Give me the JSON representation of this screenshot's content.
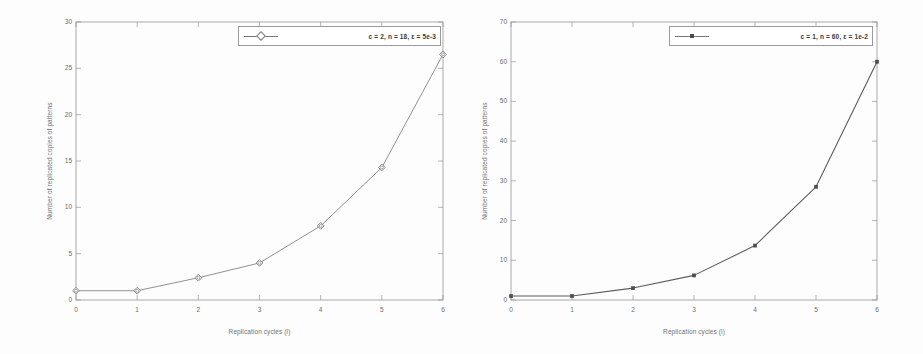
{
  "figure": {
    "panel_count": 2
  },
  "chart_data": [
    {
      "type": "line",
      "panel": "left",
      "title": "",
      "xlabel": "Replication cycles (l)",
      "ylabel": "Number of replicated copies of patterns",
      "x": [
        0,
        1,
        2,
        3,
        4,
        5,
        6
      ],
      "values": [
        1,
        1,
        2.4,
        4,
        8,
        14.3,
        26.5
      ],
      "series": [
        {
          "name": "c = 2, n = 18, ε = 5e-3",
          "values": [
            1,
            1,
            2.4,
            4,
            8,
            14.3,
            26.5
          ],
          "marker": "open-diamond",
          "color": "#777777"
        }
      ],
      "xlim": [
        0,
        6
      ],
      "ylim": [
        0,
        30
      ],
      "xticks": [
        "0",
        "1",
        "2",
        "3",
        "4",
        "5",
        "6"
      ],
      "yticks": [
        "0",
        "5",
        "10",
        "15",
        "20",
        "25",
        "30"
      ],
      "ytick_values": [
        0,
        5,
        10,
        15,
        20,
        25,
        30
      ],
      "xtick_values": [
        0,
        1,
        2,
        3,
        4,
        5,
        6
      ],
      "grid": false,
      "legend_position": "top-right",
      "legend": {
        "entries": [
          {
            "label": "c = 2, n = 18, ε = 5e-3",
            "marker": "open-diamond"
          }
        ]
      }
    },
    {
      "type": "line",
      "panel": "right",
      "title": "",
      "xlabel": "Replication cycles (l)",
      "ylabel": "Number of replicated copies of patterns",
      "x": [
        0,
        1,
        2,
        3,
        4,
        5,
        6
      ],
      "values": [
        1,
        1,
        3,
        6.2,
        13.7,
        28.5,
        60
      ],
      "series": [
        {
          "name": "c = 1, n = 60, ε = 1e-2",
          "values": [
            1,
            1,
            3,
            6.2,
            13.7,
            28.5,
            60
          ],
          "marker": "filled-square",
          "color": "#4a4a4a"
        }
      ],
      "xlim": [
        0,
        6
      ],
      "ylim": [
        0,
        70
      ],
      "xticks": [
        "0",
        "1",
        "2",
        "3",
        "4",
        "5",
        "6"
      ],
      "yticks": [
        "0",
        "10",
        "20",
        "30",
        "40",
        "50",
        "60",
        "70"
      ],
      "ytick_values": [
        0,
        10,
        20,
        30,
        40,
        50,
        60,
        70
      ],
      "xtick_values": [
        0,
        1,
        2,
        3,
        4,
        5,
        6
      ],
      "grid": false,
      "legend_position": "top-right",
      "legend": {
        "entries": [
          {
            "label": "c = 1, n = 60, ε = 1e-2",
            "marker": "filled-square"
          }
        ]
      }
    }
  ],
  "colors": {
    "axis": "#8d8d8d",
    "left_series": "#777777",
    "right_series": "#4a4a4a",
    "text": "#5c5c5c",
    "background": "#ffffff"
  }
}
